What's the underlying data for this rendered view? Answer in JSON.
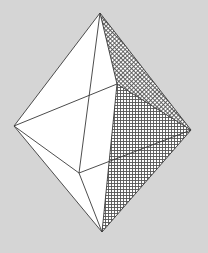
{
  "diagram": {
    "background": "#d5d5d5",
    "face_fill": "#ffffff",
    "edge_color": "#3a3a3a",
    "hatch_color": "#555555",
    "vertices": {
      "top": [
        100,
        13
      ],
      "bottom": [
        102,
        232
      ],
      "left": [
        14,
        126
      ],
      "right": [
        191,
        130
      ],
      "front": [
        117,
        84
      ],
      "back": [
        79,
        173
      ]
    },
    "faces": [
      {
        "name": "top-left-front",
        "points": [
          "top",
          "left",
          "front"
        ],
        "fill": "white"
      },
      {
        "name": "top-front-right",
        "points": [
          "top",
          "front",
          "right"
        ],
        "fill": "hatch-fine"
      },
      {
        "name": "bottom-left-front",
        "points": [
          "left",
          "front",
          "bottom"
        ],
        "fill": "white"
      },
      {
        "name": "bottom-front-right",
        "points": [
          "front",
          "right",
          "bottom"
        ],
        "fill": "hatch"
      }
    ],
    "edges": [
      [
        "top",
        "left"
      ],
      [
        "top",
        "right"
      ],
      [
        "top",
        "front"
      ],
      [
        "top",
        "back"
      ],
      [
        "bottom",
        "left"
      ],
      [
        "bottom",
        "right"
      ],
      [
        "bottom",
        "front"
      ],
      [
        "bottom",
        "back"
      ],
      [
        "left",
        "front"
      ],
      [
        "front",
        "right"
      ],
      [
        "left",
        "back"
      ],
      [
        "back",
        "right"
      ]
    ]
  }
}
